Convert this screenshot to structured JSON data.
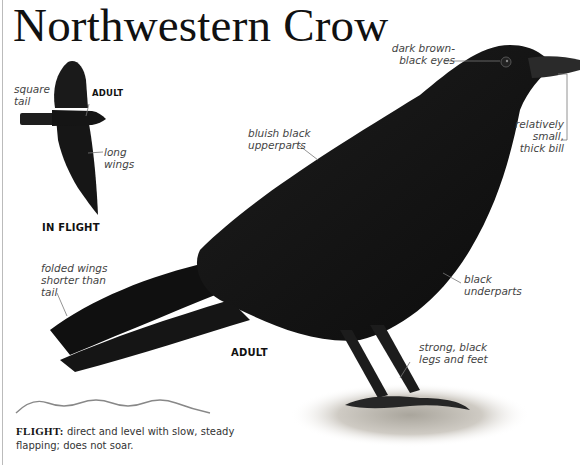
{
  "title": "Northwestern Crow",
  "inset": {
    "label_age": "ADULT",
    "caption": "IN FLIGHT",
    "annotations": {
      "square_tail": [
        "square",
        "tail"
      ],
      "long_wings": [
        "long",
        "wings"
      ]
    }
  },
  "main": {
    "label_age": "ADULT",
    "annotations": {
      "eyes": [
        "dark brown-",
        "black eyes"
      ],
      "bill": [
        "relatively",
        "small,",
        "thick bill"
      ],
      "upperparts": [
        "bluish black",
        "upperparts"
      ],
      "wings": [
        "folded wings",
        "shorter than",
        "tail"
      ],
      "underparts": [
        "black",
        "underparts"
      ],
      "legs": [
        "strong, black",
        "legs and feet"
      ]
    }
  },
  "flight": {
    "heading": "FLIGHT:",
    "description": "direct and level with slow, steady flapping; does not soar."
  },
  "colors": {
    "bird": "#141414",
    "ground": "#b9b5ad",
    "leader_line": "#777777",
    "wave": "#888888"
  }
}
